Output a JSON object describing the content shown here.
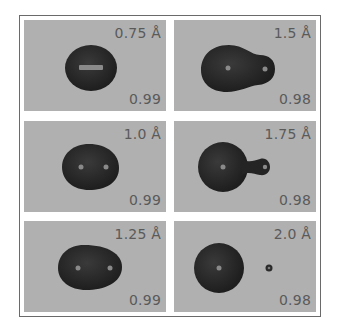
{
  "figure": {
    "colors": {
      "panel_bg": "#b0b0b0",
      "blob": "#2c2c2c",
      "nucleus": "#8a8a8a",
      "label": "#5a5a5a",
      "frame": "#6a6a6a"
    },
    "panels": [
      {
        "distance": "0.75 Å",
        "score": "0.99",
        "shape": "single-elongated-nucleus"
      },
      {
        "distance": "1.5 Å",
        "score": "0.98",
        "shape": "merged-pear"
      },
      {
        "distance": "1.0 Å",
        "score": "0.99",
        "shape": "egg-two-nuclei"
      },
      {
        "distance": "1.75 Å",
        "score": "0.98",
        "shape": "sphere-with-small-lobe"
      },
      {
        "distance": "1.25 Å",
        "score": "0.99",
        "shape": "egg-two-nuclei-wider"
      },
      {
        "distance": "2.0 Å",
        "score": "0.98",
        "shape": "separated-sphere-and-dot"
      }
    ]
  }
}
